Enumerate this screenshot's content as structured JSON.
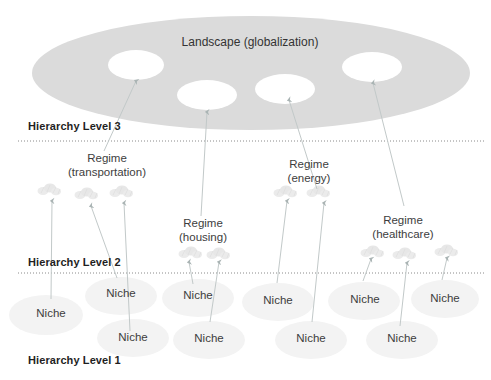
{
  "diagram": {
    "landscape_label": "Landscape (globalization)",
    "hierarchy_levels": [
      {
        "label": "Hierarchy Level 3"
      },
      {
        "label": "Hierarchy Level 2"
      },
      {
        "label": "Hierarchy Level 1"
      }
    ],
    "regimes": [
      {
        "line1": "Regime",
        "line2": "(transportation)"
      },
      {
        "line1": "Regime",
        "line2": "(housing)"
      },
      {
        "line1": "Regime",
        "line2": "(energy)"
      },
      {
        "line1": "Regime",
        "line2": "(healthcare)"
      }
    ],
    "niches": [
      {
        "label": "Niche"
      },
      {
        "label": "Niche"
      },
      {
        "label": "Niche"
      },
      {
        "label": "Niche"
      },
      {
        "label": "Niche"
      },
      {
        "label": "Niche"
      },
      {
        "label": "Niche"
      },
      {
        "label": "Niche"
      },
      {
        "label": "Niche"
      },
      {
        "label": "Niche"
      }
    ],
    "colors": {
      "landscape_fill": "#dbdbdb",
      "landscape_window_fill": "#ffffff",
      "niche_fill": "#f3f3f3",
      "regime_cluster": "#e7e7e7",
      "arrow_line": "#c2c9c9",
      "arrow_head": "#aab4b4",
      "dotted_line": "#8a8a8a",
      "heading_text": "#1f1f1f",
      "label_text": "#3d3d3d"
    }
  }
}
